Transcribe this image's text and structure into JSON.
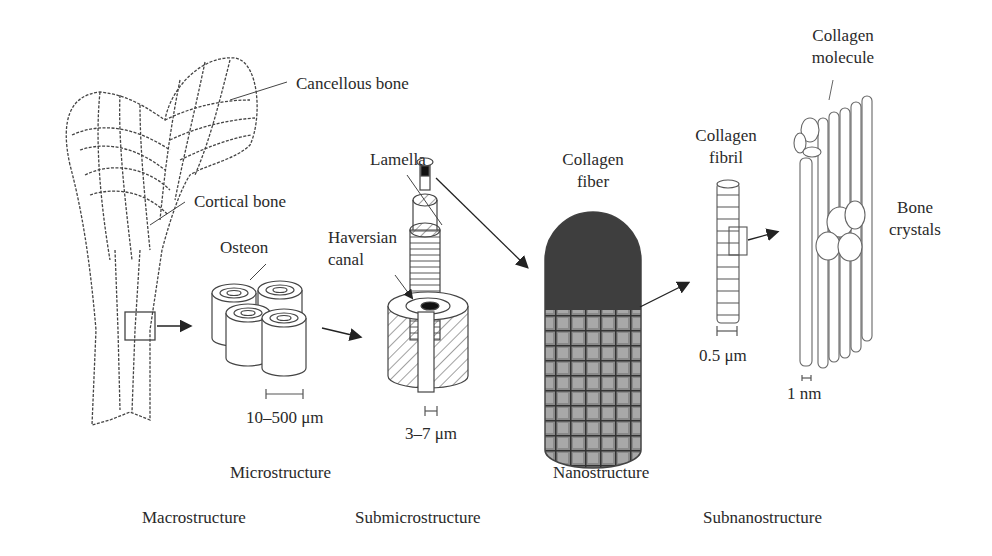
{
  "figure": {
    "components": {
      "cancellous_bone": "Cancellous bone",
      "cortical_bone": "Cortical bone",
      "osteon": "Osteon",
      "haversian_canal_line1": "Haversian",
      "haversian_canal_line2": "canal",
      "lamella": "Lamella",
      "collagen_fiber_line1": "Collagen",
      "collagen_fiber_line2": "fiber",
      "collagen_fibril_line1": "Collagen",
      "collagen_fibril_line2": "fibril",
      "collagen_molecule_line1": "Collagen",
      "collagen_molecule_line2": "molecule",
      "bone_crystals_line1": "Bone",
      "bone_crystals_line2": "crystals"
    },
    "scales": {
      "osteon": "10–500 μm",
      "lamella": "3–7 μm",
      "fibril": "0.5 μm",
      "molecule": "1 nm"
    },
    "levels": {
      "macro": "Macrostructure",
      "micro": "Microstructure",
      "submicro": "Submicrostructure",
      "nano": "Nanostructure",
      "subnano": "Subnanostructure"
    },
    "colors": {
      "line": "#3a3a3a",
      "fiber_fill": "#4a4a4a",
      "background": "#ffffff"
    }
  }
}
